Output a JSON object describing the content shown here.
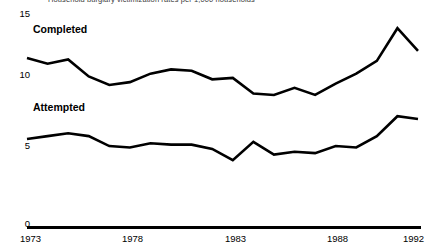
{
  "subtitle": "Household burglary victimization rates per 1,000 households",
  "axis": {
    "y_ticks": [
      "15",
      "10",
      "5",
      "0"
    ],
    "x_ticks": [
      "1973",
      "1978",
      "1983",
      "1988",
      "1992"
    ]
  },
  "labels": {
    "completed": "Completed",
    "attempted": "Attempted"
  },
  "colors": {
    "line": "#000000",
    "axis": "#000000",
    "background": "#ffffff",
    "text": "#000000"
  },
  "chart_data": {
    "type": "line",
    "title": "",
    "subtitle": "Household burglary victimization rates per 1,000 households",
    "xlabel": "",
    "ylabel": "",
    "xlim": [
      1973,
      1992
    ],
    "ylim": [
      0,
      15
    ],
    "y_ticks": [
      0,
      5,
      10,
      15
    ],
    "x_ticks": [
      1973,
      1978,
      1983,
      1988,
      1992
    ],
    "grid": false,
    "legend": "inline-series-labels",
    "x": [
      1973,
      1974,
      1975,
      1976,
      1977,
      1978,
      1979,
      1980,
      1981,
      1982,
      1983,
      1984,
      1985,
      1986,
      1987,
      1988,
      1989,
      1990,
      1991,
      1992
    ],
    "series": [
      {
        "name": "Completed",
        "label_position": "above-line-left",
        "values": [
          11.9,
          11.5,
          11.8,
          10.6,
          10.0,
          10.2,
          10.8,
          11.1,
          11.0,
          10.4,
          10.5,
          9.4,
          9.3,
          9.8,
          9.3,
          10.1,
          10.8,
          11.7,
          14.0,
          12.4
        ]
      },
      {
        "name": "Attempted",
        "label_position": "above-line-left",
        "values": [
          6.2,
          6.4,
          6.6,
          6.4,
          5.7,
          5.6,
          5.9,
          5.8,
          5.8,
          5.5,
          4.7,
          6.0,
          5.1,
          5.3,
          5.2,
          5.7,
          5.6,
          6.4,
          7.8,
          7.6
        ]
      }
    ]
  }
}
